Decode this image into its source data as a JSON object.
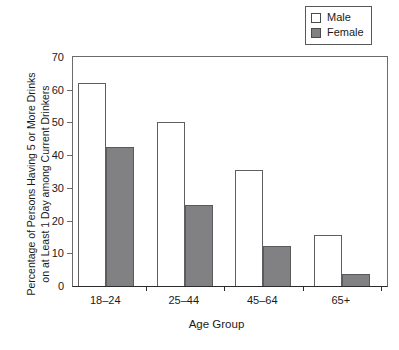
{
  "chart_data": {
    "type": "bar",
    "title": "",
    "subtitle": "",
    "xlabel": "Age Group",
    "ylabel_line1": "Percentage of Persons Having 5 or More Drinks",
    "ylabel_line2": "on at Least 1 Day among Current Drinkers",
    "categories": [
      "18–24",
      "25–44",
      "45–64",
      "65+"
    ],
    "series": [
      {
        "name": "Male",
        "values": [
          62,
          50,
          35.5,
          15.7
        ],
        "color": "#ffffff"
      },
      {
        "name": "Female",
        "values": [
          42.4,
          24.8,
          12.1,
          3.6
        ],
        "color": "#818183"
      }
    ],
    "ylim": [
      0,
      70
    ],
    "yticks": [
      0,
      10,
      20,
      30,
      40,
      50,
      60,
      70
    ],
    "ytick_labels": [
      "0",
      "10",
      "20",
      "30",
      "40",
      "50",
      "60",
      "70"
    ],
    "grid": false,
    "legend_position": "top-right"
  },
  "legend": {
    "items": [
      {
        "label": "Male",
        "swatch": "open-square-swatch"
      },
      {
        "label": "Female",
        "swatch": "filled-square-swatch"
      }
    ]
  }
}
